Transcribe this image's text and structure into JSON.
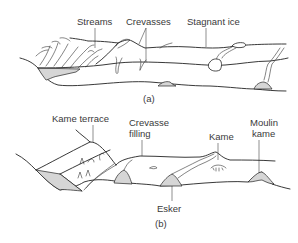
{
  "panel_a": {
    "caption": "(a)",
    "labels": {
      "streams": "Streams",
      "crevasses": "Crevasses",
      "stagnant_ice": "Stagnant ice"
    }
  },
  "panel_b": {
    "caption": "(b)",
    "labels": {
      "kame_terrace": "Kame terrace",
      "crevasse_filling_line1": "Crevasse",
      "crevasse_filling_line2": "filling",
      "kame": "Kame",
      "moulin_kame_line1": "Moulin",
      "moulin_kame_line2": "kame",
      "esker": "Esker"
    }
  },
  "colors": {
    "line": "#222222",
    "shade": "#d6d6d6",
    "text": "#3a3a3a",
    "background": "#ffffff"
  }
}
